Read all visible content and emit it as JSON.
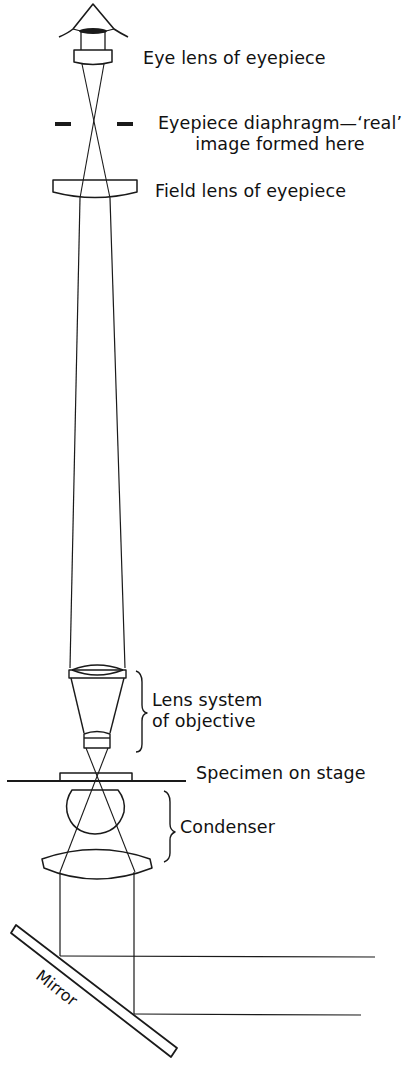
{
  "figure": {
    "type": "optical-ray-diagram"
  },
  "labels": {
    "eye_lens": "Eye lens of eyepiece",
    "diaphragm_line1": "Eyepiece diaphragm—‘real’",
    "diaphragm_line2": "image formed here",
    "field_lens": "Field lens of eyepiece",
    "objective_line1": "Lens system",
    "objective_line2": "of objective",
    "specimen": "Specimen on stage",
    "condenser": "Condenser",
    "mirror": "Mirror"
  },
  "components": [
    {
      "id": "eye",
      "name": "Observer eye"
    },
    {
      "id": "eye-lens",
      "name": "Eye lens of eyepiece"
    },
    {
      "id": "diaphragm",
      "name": "Eyepiece diaphragm"
    },
    {
      "id": "field-lens",
      "name": "Field lens of eyepiece"
    },
    {
      "id": "objective",
      "name": "Lens system of objective"
    },
    {
      "id": "stage",
      "name": "Specimen on stage"
    },
    {
      "id": "condenser",
      "name": "Condenser"
    },
    {
      "id": "mirror",
      "name": "Mirror"
    }
  ],
  "colors": {
    "ink": "#1a1a1a",
    "background": "#ffffff"
  }
}
